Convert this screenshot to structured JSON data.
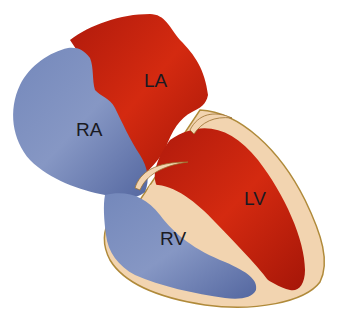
{
  "diagram": {
    "labels": {
      "ra": "RA",
      "la": "LA",
      "rv": "RV",
      "lv": "LV"
    },
    "colors": {
      "background": "#ffffff",
      "deoxygenated": "#6b7fb0",
      "deoxygenated_dark": "#4d5f95",
      "oxygenated": "#c4200e",
      "oxygenated_dark": "#9e1508",
      "myocardium": "#f2d4b0",
      "outline": "#b08a3a"
    }
  }
}
